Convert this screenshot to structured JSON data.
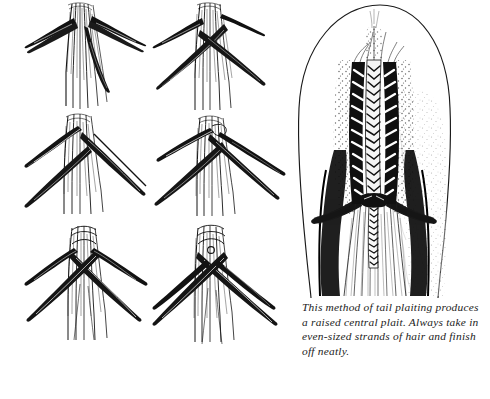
{
  "figure": {
    "caption_lines": [
      "This method of tail plaiting produces",
      "a raised central plait. Always take in",
      "even-sized strands of hair and finish",
      "off neatly."
    ],
    "caption_full": "This method of tail plaiting produces a raised central plait. Always take in even-sized strands of hair and finish off neatly.",
    "ink_color": "#111111",
    "background_color": "#ffffff"
  },
  "steps": [
    {
      "index": 1,
      "name": "step-1-three-strands-separated",
      "description": "Tail hair divided into strands drawn out to left and right"
    },
    {
      "index": 2,
      "name": "step-2-first-cross",
      "description": "Left strand crossed over the centre strand"
    },
    {
      "index": 3,
      "name": "step-3-second-cross",
      "description": "Right strand crossed over, strands pulled taut sideways"
    },
    {
      "index": 4,
      "name": "step-4-taking-in-hair",
      "description": "New hair taken in from the side of the dock"
    },
    {
      "index": 5,
      "name": "step-5-plait-forming",
      "description": "Central raised plait beginning to form"
    },
    {
      "index": 6,
      "name": "step-6-plait-continued",
      "description": "Plaiting continued down the dock with even strands"
    }
  ],
  "tail_figure": {
    "name": "finished-tail-with-raised-central-plait",
    "parts": [
      "dock outline",
      "raised central plait",
      "side hair shaded",
      "loose tail hair below plait",
      "plaited tip turned under"
    ]
  }
}
